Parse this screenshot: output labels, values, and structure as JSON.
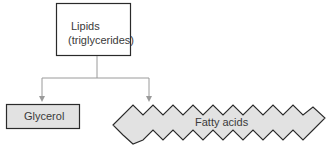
{
  "diagram": {
    "root": {
      "line1": "Lipids",
      "line2": "(triglycerides)"
    },
    "children": [
      {
        "label": "Glycerol"
      },
      {
        "label": "Fatty acids"
      }
    ],
    "colors": {
      "box_border": "#2a2a2a",
      "connector": "#9a9a9a",
      "child_fill": "#e2e2e2",
      "text": "#3a3a3a"
    }
  }
}
